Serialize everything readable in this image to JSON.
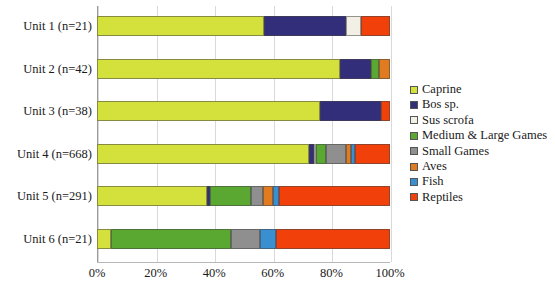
{
  "chart_data": {
    "type": "bar",
    "orientation": "horizontal",
    "stacked": true,
    "normalized_percent": true,
    "title": "",
    "xlabel": "",
    "ylabel": "",
    "xlim": [
      0,
      100
    ],
    "grid": true,
    "legend_position": "right",
    "xticklabels": [
      "0%",
      "20%",
      "40%",
      "60%",
      "80%",
      "100%"
    ],
    "xtickvalues": [
      0,
      20,
      40,
      60,
      80,
      100
    ],
    "categories": [
      "Unit 1 (n=21)",
      "Unit 2 (n=42)",
      "Unit 3 (n=38)",
      "Unit 4 (n=668)",
      "Unit 5 (n=291)",
      "Unit 6 (n=21)"
    ],
    "series": [
      {
        "name": "Caprine",
        "color": "#d4e13c",
        "values": [
          57.0,
          83.0,
          76.0,
          72.5,
          37.5,
          4.8
        ]
      },
      {
        "name": "Bos sp.",
        "color": "#332e7a",
        "values": [
          28.0,
          10.5,
          21.0,
          1.4,
          1.0,
          0.0
        ]
      },
      {
        "name": "Sus scrofa",
        "color": "#f2f0e4",
        "values": [
          5.0,
          0.0,
          0.0,
          1.0,
          0.0,
          0.0
        ]
      },
      {
        "name": "Medium & Large Games",
        "color": "#5aa832",
        "values": [
          0.0,
          2.6,
          0.0,
          3.2,
          14.0,
          41.0
        ]
      },
      {
        "name": "Small Games",
        "color": "#8f8f8f",
        "values": [
          0.0,
          0.0,
          0.0,
          7.0,
          4.0,
          10.0
        ]
      },
      {
        "name": "Aves",
        "color": "#e07b20",
        "values": [
          0.0,
          3.9,
          0.0,
          1.5,
          3.5,
          0.0
        ]
      },
      {
        "name": "Fish",
        "color": "#3a8fd0",
        "values": [
          0.0,
          0.0,
          0.0,
          1.6,
          2.0,
          5.2
        ]
      },
      {
        "name": "Reptiles",
        "color": "#f2400a",
        "values": [
          10.0,
          0.0,
          3.0,
          11.8,
          38.0,
          39.0
        ]
      }
    ]
  },
  "legend": {
    "items": [
      {
        "label": "Caprine",
        "color": "#d4e13c"
      },
      {
        "label": "Bos sp.",
        "color": "#332e7a"
      },
      {
        "label": "Sus scrofa",
        "color": "#f2f0e4"
      },
      {
        "label": "Medium & Large Games",
        "color": "#5aa832"
      },
      {
        "label": "Small Games",
        "color": "#8f8f8f"
      },
      {
        "label": "Aves",
        "color": "#e07b20"
      },
      {
        "label": "Fish",
        "color": "#3a8fd0"
      },
      {
        "label": "Reptiles",
        "color": "#f2400a"
      }
    ]
  }
}
